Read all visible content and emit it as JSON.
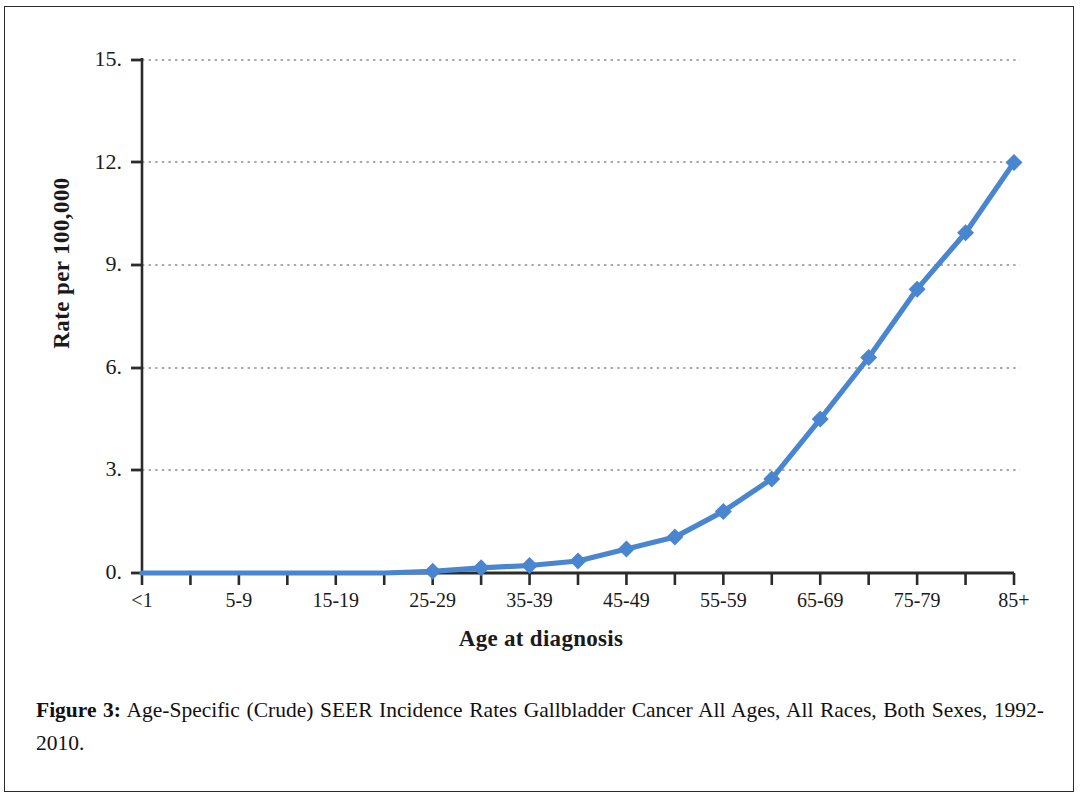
{
  "figure": {
    "caption_label": "Figure 3:",
    "caption_text": " Age-Specific (Crude) SEER Incidence Rates Gallbladder Cancer All Ages, All Races, Both Sexes, 1992-2010."
  },
  "chart_data": {
    "type": "line",
    "title": "",
    "xlabel": "Age at diagnosis",
    "ylabel": "Rate per 100,000",
    "ylim": [
      0,
      15
    ],
    "ytick_labels": [
      "0.",
      "3.",
      "6.",
      "9.",
      "12.",
      "15."
    ],
    "ytick_values": [
      0,
      3,
      6,
      9,
      12,
      15
    ],
    "grid": "horizontal-dotted",
    "legend": "none",
    "line_color": "#4a86d0",
    "marker_color": "#4a86d0",
    "marker_shape": "diamond",
    "categories": [
      "<1",
      "1-4",
      "5-9",
      "10-14",
      "15-19",
      "20-24",
      "25-29",
      "30-34",
      "35-39",
      "40-44",
      "45-49",
      "50-54",
      "55-59",
      "60-64",
      "65-69",
      "70-74",
      "75-79",
      "80-84",
      "85+"
    ],
    "xtick_labels_shown": [
      "<1",
      "5-9",
      "15-19",
      "25-29",
      "35-39",
      "45-49",
      "55-59",
      "65-69",
      "75-79",
      "85+"
    ],
    "values": [
      0.0,
      0.0,
      0.0,
      0.0,
      0.0,
      0.0,
      0.05,
      0.15,
      0.22,
      0.35,
      0.7,
      1.05,
      1.8,
      2.75,
      4.5,
      6.3,
      8.3,
      9.95,
      12.0
    ]
  },
  "colors": {
    "line": "#4a86d0",
    "axis": "#2b2b2b",
    "grid": "#8d8d8d",
    "text": "#1a1a1a",
    "page_border": "#2b2b2b"
  }
}
